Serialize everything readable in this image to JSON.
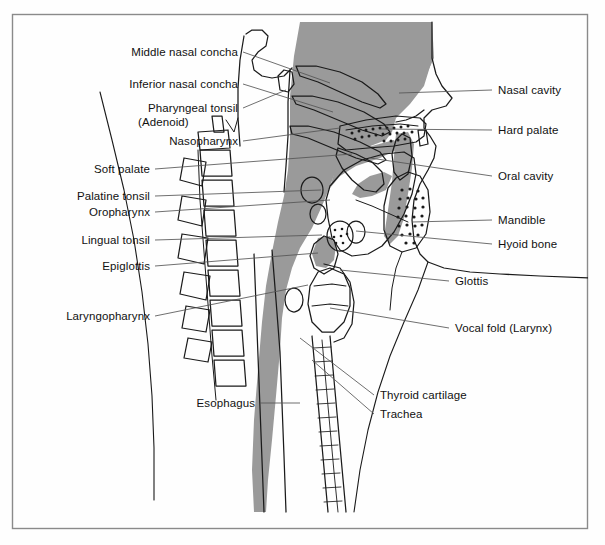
{
  "figure": {
    "border_color": "#8a8a8a",
    "background_color": "#fefefe",
    "mucosa_fill": "#9a9a9a",
    "line_color": "#1a1a1a",
    "leader_color": "#555555"
  },
  "labels_left": [
    {
      "id": "middle-nasal-concha",
      "text": "Middle nasal concha",
      "x": 118,
      "y": 46,
      "width": 120,
      "leader": {
        "x1": 243,
        "y1": 52,
        "x2": 330,
        "y2": 83
      }
    },
    {
      "id": "inferior-nasal-concha",
      "text": "Inferior nasal concha",
      "x": 118,
      "y": 78,
      "width": 120,
      "leader": {
        "x1": 243,
        "y1": 84,
        "x2": 333,
        "y2": 112
      }
    },
    {
      "id": "pharyngeal-tonsil",
      "text": "Pharyngeal tonsil",
      "x": 138,
      "y": 102,
      "width": 100,
      "leader": {
        "x1": 243,
        "y1": 108,
        "x2": 286,
        "y2": 90
      }
    },
    {
      "id": "pharyngeal-tonsil-alt",
      "text": "(Adenoid)",
      "x": 138,
      "y": 116,
      "width": 100,
      "leader": null
    },
    {
      "id": "nasopharynx",
      "text": "Nasopharynx",
      "x": 148,
      "y": 135,
      "width": 90,
      "leader": {
        "x1": 243,
        "y1": 141,
        "x2": 340,
        "y2": 128
      }
    },
    {
      "id": "soft-palate",
      "text": "Soft palate",
      "x": 62,
      "y": 163,
      "width": 88,
      "leader": {
        "x1": 155,
        "y1": 169,
        "x2": 352,
        "y2": 154
      }
    },
    {
      "id": "palatine-tonsil",
      "text": "Palatine tonsil",
      "x": 50,
      "y": 190,
      "width": 100,
      "leader": {
        "x1": 155,
        "y1": 196,
        "x2": 321,
        "y2": 190
      }
    },
    {
      "id": "oropharynx",
      "text": "Oropharynx",
      "x": 60,
      "y": 206,
      "width": 90,
      "leader": {
        "x1": 155,
        "y1": 212,
        "x2": 330,
        "y2": 200
      }
    },
    {
      "id": "lingual-tonsil",
      "text": "Lingual tonsil",
      "x": 55,
      "y": 234,
      "width": 95,
      "leader": {
        "x1": 155,
        "y1": 240,
        "x2": 322,
        "y2": 235
      }
    },
    {
      "id": "epiglottis",
      "text": "Epiglottis",
      "x": 70,
      "y": 260,
      "width": 80,
      "leader": {
        "x1": 155,
        "y1": 266,
        "x2": 318,
        "y2": 253
      }
    },
    {
      "id": "laryngopharynx",
      "text": "Laryngopharynx",
      "x": 44,
      "y": 310,
      "width": 106,
      "leader": {
        "x1": 155,
        "y1": 316,
        "x2": 308,
        "y2": 285
      }
    },
    {
      "id": "esophagus",
      "text": "Esophagus",
      "x": 175,
      "y": 397,
      "width": 80,
      "leader": {
        "x1": 260,
        "y1": 403,
        "x2": 300,
        "y2": 403
      }
    }
  ],
  "labels_right": [
    {
      "id": "nasal-cavity",
      "text": "Nasal cavity",
      "x": 498,
      "y": 84,
      "leader": {
        "x1": 492,
        "y1": 90,
        "x2": 399,
        "y2": 93
      }
    },
    {
      "id": "hard-palate",
      "text": "Hard palate",
      "x": 498,
      "y": 124,
      "leader": {
        "x1": 492,
        "y1": 130,
        "x2": 381,
        "y2": 129
      }
    },
    {
      "id": "oral-cavity",
      "text": "Oral cavity",
      "x": 498,
      "y": 170,
      "leader": {
        "x1": 492,
        "y1": 176,
        "x2": 370,
        "y2": 158
      }
    },
    {
      "id": "mandible",
      "text": "Mandible",
      "x": 498,
      "y": 214,
      "leader": {
        "x1": 492,
        "y1": 220,
        "x2": 412,
        "y2": 222
      }
    },
    {
      "id": "hyoid-bone",
      "text": "Hyoid bone",
      "x": 498,
      "y": 238,
      "leader": {
        "x1": 492,
        "y1": 244,
        "x2": 356,
        "y2": 231
      }
    },
    {
      "id": "glottis",
      "text": "Glottis",
      "x": 455,
      "y": 275,
      "leader": {
        "x1": 449,
        "y1": 281,
        "x2": 340,
        "y2": 270
      }
    },
    {
      "id": "vocal-fold",
      "text": "Vocal fold (Larynx)",
      "x": 455,
      "y": 322,
      "leader": {
        "x1": 449,
        "y1": 328,
        "x2": 330,
        "y2": 308
      }
    },
    {
      "id": "thyroid-cartilage",
      "text": "Thyroid cartilage",
      "x": 380,
      "y": 389,
      "leader": {
        "x1": 374,
        "y1": 395,
        "x2": 300,
        "y2": 338
      }
    },
    {
      "id": "trachea",
      "text": "Trachea",
      "x": 380,
      "y": 408,
      "leader": {
        "x1": 374,
        "y1": 414,
        "x2": 312,
        "y2": 360
      }
    }
  ]
}
